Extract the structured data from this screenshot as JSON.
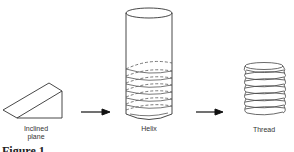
{
  "diagram": {
    "stages": [
      {
        "id": "inclined-plane",
        "label_line1": "Inclined",
        "label_line2": "plane"
      },
      {
        "id": "helix",
        "label_line1": "Helix"
      },
      {
        "id": "thread",
        "label_line1": "Thread"
      }
    ],
    "arrows": [
      {
        "from": "inclined-plane",
        "to": "helix"
      },
      {
        "from": "helix",
        "to": "thread"
      }
    ],
    "caption": "Figure 1"
  }
}
